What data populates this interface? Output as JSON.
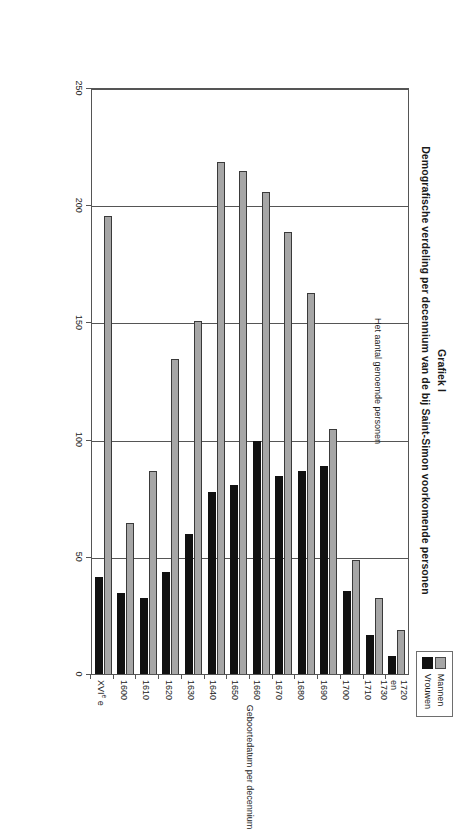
{
  "figure": {
    "label": "Grafiek I",
    "title": "Demografische verdeling per decennium van de bij Saint-Simon voorkomende personen"
  },
  "legend": {
    "position": "top-right",
    "items": [
      {
        "label": "Mannen",
        "color": "#a6a6a6"
      },
      {
        "label": "Vrouwen",
        "color": "#111111"
      }
    ]
  },
  "axes": {
    "value_axis_title": "Het aantal genoemde personen",
    "category_axis_title": "Geboortedatum per decennium",
    "value_ticks": [
      "0",
      "50",
      "100",
      "150",
      "200",
      "250"
    ]
  },
  "chart_data": {
    "type": "bar",
    "orientation": "vertical",
    "title": "Demografische verdeling per decennium van de bij Saint-Simon voorkomende personen",
    "subtitle": "Grafiek I",
    "xlabel": "Geboortedatum per decennium",
    "ylabel": "Het aantal genoemde personen",
    "ylim": [
      0,
      250
    ],
    "ytick_step": 50,
    "grid": true,
    "legend_position": "top-right",
    "categories": [
      "XVIe e",
      "1600",
      "1610",
      "1620",
      "1630",
      "1640",
      "1650",
      "1660",
      "1670",
      "1680",
      "1690",
      "1700",
      "1710",
      "1720 en 1730"
    ],
    "category_labels_multiline": [
      [
        "XVIe e"
      ],
      [
        "1600"
      ],
      [
        "1610"
      ],
      [
        "1620"
      ],
      [
        "1630"
      ],
      [
        "1640"
      ],
      [
        "1650"
      ],
      [
        "1660"
      ],
      [
        "1670"
      ],
      [
        "1680"
      ],
      [
        "1690"
      ],
      [
        "1700"
      ],
      [
        "1710"
      ],
      [
        "1720",
        "en",
        "1730"
      ]
    ],
    "series": [
      {
        "name": "Mannen",
        "color": "#a6a6a6",
        "values": [
          196,
          65,
          87,
          135,
          151,
          219,
          215,
          206,
          189,
          163,
          105,
          49,
          33,
          19
        ]
      },
      {
        "name": "Vrouwen",
        "color": "#111111",
        "values": [
          42,
          35,
          33,
          44,
          60,
          78,
          81,
          100,
          85,
          87,
          89,
          36,
          17,
          8
        ]
      }
    ]
  }
}
